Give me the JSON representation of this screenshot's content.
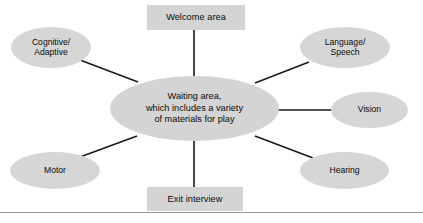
{
  "diagram": {
    "background_color": "#ffffff",
    "node_fill_color": "#d4d4d4",
    "connector_color": "#1a1a1a",
    "rule_color": "#9a9a9a",
    "center": {
      "label": "Waiting area,\nwhich includes a variety\nof materials for play",
      "shape": "ellipse",
      "x": 110,
      "y": 76,
      "width": 169,
      "height": 65
    },
    "nodes": [
      {
        "id": "welcome-area",
        "label": "Welcome area",
        "shape": "rectangle",
        "x": 147,
        "y": 5,
        "width": 98,
        "height": 25
      },
      {
        "id": "cognitive-adaptive",
        "label": "Cognitive/\nAdaptive",
        "shape": "ellipse",
        "x": 11,
        "y": 27,
        "width": 80,
        "height": 41
      },
      {
        "id": "language-speech",
        "label": "Language/\nSpeech",
        "shape": "ellipse",
        "x": 300,
        "y": 27,
        "width": 90,
        "height": 41
      },
      {
        "id": "vision",
        "label": "Vision",
        "shape": "ellipse",
        "x": 331,
        "y": 92,
        "width": 77,
        "height": 36
      },
      {
        "id": "hearing",
        "label": "Hearing",
        "shape": "ellipse",
        "x": 300,
        "y": 152,
        "width": 89,
        "height": 37
      },
      {
        "id": "motor",
        "label": "Motor",
        "shape": "ellipse",
        "x": 10,
        "y": 152,
        "width": 90,
        "height": 37
      },
      {
        "id": "exit-interview",
        "label": "Exit interview",
        "shape": "rectangle",
        "x": 147,
        "y": 187,
        "width": 96,
        "height": 24
      }
    ],
    "connectors": [
      {
        "id": "center-to-welcome-area",
        "x1": 194,
        "y1": 78,
        "x2": 194,
        "y2": 30
      },
      {
        "id": "center-to-cognitive-adaptive",
        "x1": 138,
        "y1": 82,
        "x2": 80,
        "y2": 60
      },
      {
        "id": "center-to-language-speech",
        "x1": 255,
        "y1": 83,
        "x2": 309,
        "y2": 62
      },
      {
        "id": "center-to-vision",
        "x1": 278,
        "y1": 110,
        "x2": 332,
        "y2": 110
      },
      {
        "id": "center-to-hearing",
        "x1": 255,
        "y1": 136,
        "x2": 313,
        "y2": 158
      },
      {
        "id": "center-to-motor",
        "x1": 137,
        "y1": 136,
        "x2": 80,
        "y2": 157
      },
      {
        "id": "center-to-exit-interview",
        "x1": 194,
        "y1": 140,
        "x2": 194,
        "y2": 187
      }
    ],
    "bottom_rule": {
      "y": 212
    }
  }
}
